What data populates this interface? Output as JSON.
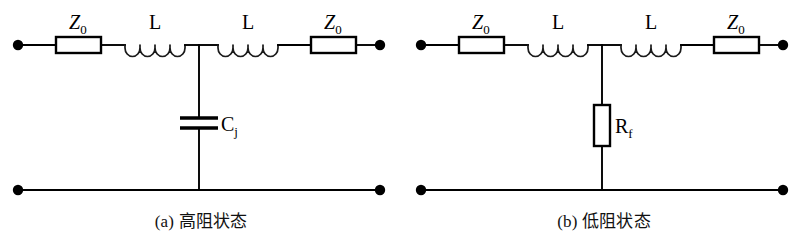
{
  "figure": {
    "background_color": "#ffffff",
    "line_color": "#000000",
    "type": "circuit-schematic-pair"
  },
  "panels": [
    {
      "id": "a",
      "caption": "(a) 高阻状态",
      "components": {
        "series_resistor_left": "Z",
        "series_resistor_left_sub": "0",
        "inductor_left": "L",
        "inductor_right": "L",
        "series_resistor_right": "Z",
        "series_resistor_right_sub": "0",
        "shunt_label": "C",
        "shunt_label_sub": "j",
        "shunt_type": "capacitor"
      }
    },
    {
      "id": "b",
      "caption": "(b) 低阻状态",
      "components": {
        "series_resistor_left": "Z",
        "series_resistor_left_sub": "0",
        "inductor_left": "L",
        "inductor_right": "L",
        "series_resistor_right": "Z",
        "series_resistor_right_sub": "0",
        "shunt_label": "R",
        "shunt_label_sub": "f",
        "shunt_type": "resistor"
      }
    }
  ]
}
